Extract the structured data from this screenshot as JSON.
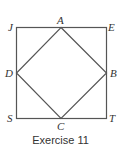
{
  "figure": {
    "caption": "Exercise 11",
    "stroke_color": "#555555",
    "outer_square": {
      "vertices": [
        "J",
        "E",
        "T",
        "S"
      ]
    },
    "inner_square": {
      "vertices": [
        "A",
        "B",
        "C",
        "D"
      ]
    },
    "labels": {
      "J": "J",
      "A": "A",
      "E": "E",
      "D": "D",
      "B": "B",
      "S": "S",
      "C": "C",
      "T": "T"
    }
  }
}
